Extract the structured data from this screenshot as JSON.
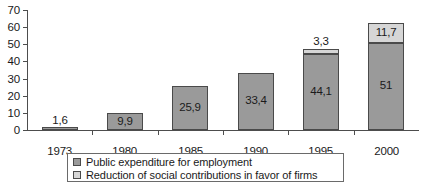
{
  "chart_data": {
    "type": "bar",
    "subtype": "stacked-vertical",
    "title": "",
    "xlabel": "",
    "ylabel": "",
    "ylim": [
      0,
      70
    ],
    "ytick_step": 10,
    "ytick_labels": [
      "0",
      "10",
      "20",
      "30",
      "40",
      "50",
      "60",
      "70"
    ],
    "grid": false,
    "legend_position": "bottom",
    "categories": [
      "1973",
      "1980",
      "1985",
      "1990",
      "1995",
      "2000"
    ],
    "series": [
      {
        "name": "Public expenditure for employment",
        "color": "#9a9a9a",
        "values": [
          1.6,
          9.9,
          25.9,
          33.4,
          44.1,
          51
        ],
        "labels": [
          "1,6",
          "9,9",
          "25,9",
          "33,4",
          "44,1",
          "51"
        ],
        "label_placement": [
          "above",
          "inside",
          "inside",
          "inside",
          "inside",
          "inside"
        ]
      },
      {
        "name": "Reduction of social contributions in favor of firms",
        "color": "#d6d6d6",
        "values": [
          0,
          0,
          0,
          0,
          3.3,
          11.7
        ],
        "labels": [
          "",
          "",
          "",
          "",
          "3,3",
          "11,7"
        ],
        "label_placement": [
          "",
          "",
          "",
          "",
          "above",
          "inside"
        ]
      }
    ]
  },
  "legend": {
    "items": [
      {
        "label": "Public expenditure for employment",
        "swatch": "dark"
      },
      {
        "label": "Reduction of social contributions in favor of firms",
        "swatch": "light"
      }
    ]
  },
  "colors": {
    "series_dark": "#9a9a9a",
    "series_light": "#d6d6d6",
    "axis": "#4d4d4d",
    "text": "#1a1a1a",
    "background": "#ffffff"
  }
}
